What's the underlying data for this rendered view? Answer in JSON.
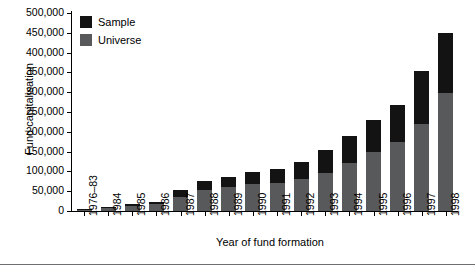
{
  "chart_data": {
    "type": "bar",
    "stacked": true,
    "title": "",
    "xlabel": "Year of fund formation",
    "ylabel": "Fund capitalisation",
    "ylim": [
      0,
      500000
    ],
    "ytick_step": 50000,
    "grid": false,
    "legend_position": "top-left",
    "categories": [
      "1976–83",
      "1984",
      "1985",
      "1986",
      "1987",
      "1988",
      "1989",
      "1990",
      "1991",
      "1992",
      "1993",
      "1994",
      "1995",
      "1996",
      "1997",
      "1998"
    ],
    "ytick_labels": [
      "500,000",
      "450,000",
      "400,000",
      "350,000",
      "300,000",
      "250,000",
      "200,000",
      "150,000",
      "100,000",
      "50,000",
      "0"
    ],
    "ytick_values": [
      500000,
      450000,
      400000,
      350000,
      300000,
      250000,
      200000,
      150000,
      100000,
      50000,
      0
    ],
    "series": [
      {
        "name": "Universe",
        "color": "#58595b",
        "values": [
          3000,
          7000,
          13000,
          18000,
          36000,
          53000,
          60000,
          68000,
          70000,
          80000,
          95000,
          120000,
          150000,
          175000,
          220000,
          298000
        ]
      },
      {
        "name": "Sample",
        "color": "#131313",
        "values": [
          1500,
          3000,
          4000,
          5000,
          17000,
          22000,
          25000,
          30000,
          35000,
          45000,
          60000,
          70000,
          80000,
          93000,
          133000,
          152000
        ]
      }
    ],
    "totals": [
      4500,
      10000,
      17000,
      23000,
      53000,
      75000,
      85000,
      98000,
      105000,
      125000,
      155000,
      190000,
      230000,
      268000,
      353000,
      450000
    ]
  },
  "legend": {
    "items": [
      {
        "label": "Sample",
        "color": "#131313"
      },
      {
        "label": "Universe",
        "color": "#58595b"
      }
    ]
  }
}
